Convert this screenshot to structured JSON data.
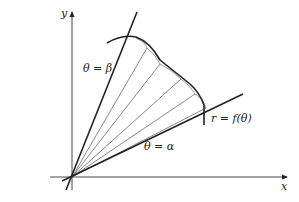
{
  "diagram": {
    "type": "polar-area-region",
    "axes": {
      "x_label": "x",
      "y_label": "y"
    },
    "labels": {
      "beta_ray": "θ = β",
      "alpha_ray": "θ = α",
      "curve": "r = f(θ)"
    },
    "elements": [
      "x-axis with arrow",
      "y-axis with arrow",
      "ray θ = β (bold)",
      "ray θ = α (bold)",
      "curve r = f(θ)",
      "radial subdivision lines (5) with small arc sectors"
    ],
    "colors": {
      "line": "#222222",
      "thin_line": "#555555",
      "background": "#ffffff"
    }
  }
}
